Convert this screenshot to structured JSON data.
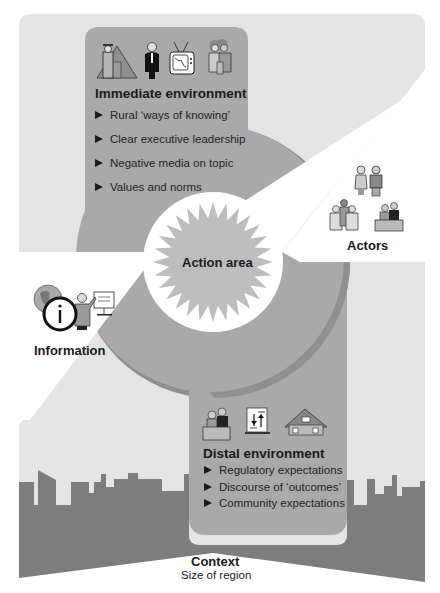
{
  "diagram": {
    "center": {
      "label": "Action area"
    },
    "immediate_environment": {
      "title": "Immediate environment",
      "icons": [
        "rural-farmer-icon",
        "executive-icon",
        "television-icon",
        "family-icon"
      ],
      "items": [
        "Rural ‘ways of knowing’",
        "Clear executive leadership",
        "Negative media on topic",
        "Values and norms"
      ]
    },
    "actors": {
      "label": "Actors",
      "icons": [
        "couple-icon",
        "group-of-people-icon",
        "officials-at-desk-icon"
      ]
    },
    "information": {
      "label": "Information",
      "icons": [
        "globe-icon",
        "info-icon",
        "presenter-icon"
      ]
    },
    "distal_environment": {
      "title": "Distal environment",
      "icons": [
        "officials-at-desk-icon",
        "balance-document-icon",
        "houses-icon"
      ],
      "items": [
        "Regulatory expectations",
        "Discourse of ‘outcomes’",
        "Community expectations"
      ]
    },
    "context": {
      "title": "Context",
      "subtitle": "Size of region"
    }
  },
  "colors": {
    "light_gray": "#e4e4e4",
    "medium_gray": "#a9a9a9",
    "crescent_shadow": "#8f8f8f",
    "skyline_gray": "#7d7d7d",
    "starburst": "#bdbdbd",
    "white": "#ffffff",
    "text": "#1a1a1a"
  }
}
